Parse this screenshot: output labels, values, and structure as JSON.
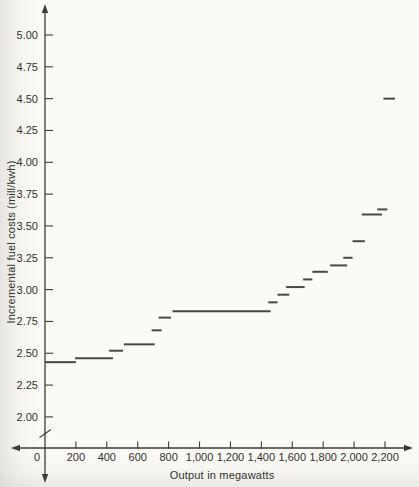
{
  "figure": {
    "bg_color": "#fbfaf7",
    "axis_color": "#3e3c39",
    "segment_color": "#4a4845",
    "text_color": "#34322f"
  },
  "chart_data": {
    "type": "line",
    "subtype": "step-function-segments",
    "title": "",
    "xlabel": "Output in megawatts",
    "ylabel": "Incremental fuel costs (mill/kwh)",
    "xlim": [
      0,
      2380
    ],
    "ylim_labeled": [
      2.0,
      5.0
    ],
    "grid": false,
    "legend_position": "none",
    "axis_break": "y-axis below 2.00 tick",
    "x_ticks": [
      {
        "value": 0,
        "label": "0"
      },
      {
        "value": 200,
        "label": "200"
      },
      {
        "value": 400,
        "label": "400"
      },
      {
        "value": 600,
        "label": "600"
      },
      {
        "value": 800,
        "label": "800"
      },
      {
        "value": 1000,
        "label": "1,000"
      },
      {
        "value": 1200,
        "label": "1,200"
      },
      {
        "value": 1400,
        "label": "1,400"
      },
      {
        "value": 1600,
        "label": "1,600"
      },
      {
        "value": 1800,
        "label": "1,800"
      },
      {
        "value": 2000,
        "label": "2,000"
      },
      {
        "value": 2200,
        "label": "2,200"
      }
    ],
    "y_ticks": [
      {
        "value": 2.0,
        "label": "2.00"
      },
      {
        "value": 2.25,
        "label": "2.25"
      },
      {
        "value": 2.5,
        "label": "2.50"
      },
      {
        "value": 2.75,
        "label": "2.75"
      },
      {
        "value": 3.0,
        "label": "3.00"
      },
      {
        "value": 3.25,
        "label": "3.25"
      },
      {
        "value": 3.5,
        "label": "3.50"
      },
      {
        "value": 3.75,
        "label": "3.75"
      },
      {
        "value": 4.0,
        "label": "4.00"
      },
      {
        "value": 4.25,
        "label": "4.25"
      },
      {
        "value": 4.5,
        "label": "4.50"
      },
      {
        "value": 4.75,
        "label": "4.75"
      },
      {
        "value": 5.0,
        "label": "5.00"
      }
    ],
    "segments": [
      {
        "x_start": 0,
        "x_end": 200,
        "y": 2.43
      },
      {
        "x_start": 195,
        "x_end": 440,
        "y": 2.46
      },
      {
        "x_start": 415,
        "x_end": 505,
        "y": 2.52
      },
      {
        "x_start": 510,
        "x_end": 710,
        "y": 2.57
      },
      {
        "x_start": 690,
        "x_end": 755,
        "y": 2.68
      },
      {
        "x_start": 735,
        "x_end": 815,
        "y": 2.78
      },
      {
        "x_start": 825,
        "x_end": 1460,
        "y": 2.83
      },
      {
        "x_start": 1445,
        "x_end": 1505,
        "y": 2.9
      },
      {
        "x_start": 1505,
        "x_end": 1580,
        "y": 2.96
      },
      {
        "x_start": 1560,
        "x_end": 1680,
        "y": 3.02
      },
      {
        "x_start": 1670,
        "x_end": 1730,
        "y": 3.08
      },
      {
        "x_start": 1730,
        "x_end": 1830,
        "y": 3.14
      },
      {
        "x_start": 1845,
        "x_end": 1955,
        "y": 3.19
      },
      {
        "x_start": 1930,
        "x_end": 1990,
        "y": 3.25
      },
      {
        "x_start": 1990,
        "x_end": 2070,
        "y": 3.38
      },
      {
        "x_start": 2050,
        "x_end": 2180,
        "y": 3.59
      },
      {
        "x_start": 2150,
        "x_end": 2215,
        "y": 3.63
      },
      {
        "x_start": 2190,
        "x_end": 2265,
        "y": 4.5
      }
    ]
  }
}
